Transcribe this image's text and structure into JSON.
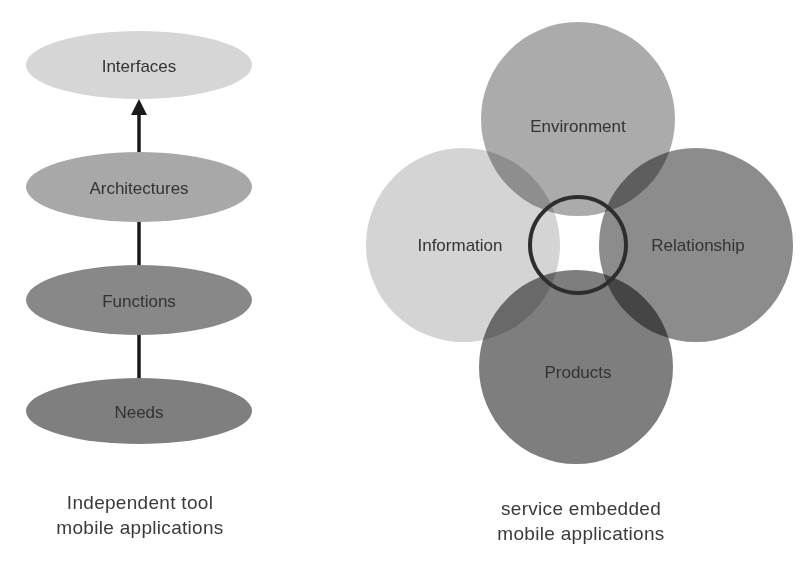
{
  "left_diagram": {
    "title": "Independent tool mobile applications",
    "caption_line1": "Independent tool",
    "caption_line2": "mobile applications",
    "nodes": [
      {
        "label": "Interfaces",
        "color": "#d6d6d6"
      },
      {
        "label": "Architectures",
        "color": "#a8a8a8"
      },
      {
        "label": "Functions",
        "color": "#888888"
      },
      {
        "label": "Needs",
        "color": "#7f7f7f"
      }
    ],
    "arrow_direction": "up",
    "connector_color": "#1a1a1a"
  },
  "right_diagram": {
    "title": "service embedded mobile applications",
    "caption_line1": "service embedded",
    "caption_line2": "mobile applications",
    "circles": [
      {
        "label": "Environment",
        "color": "#ababab"
      },
      {
        "label": "Information",
        "color": "#d4d4d4"
      },
      {
        "label": "Relationship",
        "color": "#8c8c8c"
      },
      {
        "label": "Products",
        "color": "#7e7e7e"
      }
    ],
    "center_ring_color": "#2e2e2e"
  }
}
